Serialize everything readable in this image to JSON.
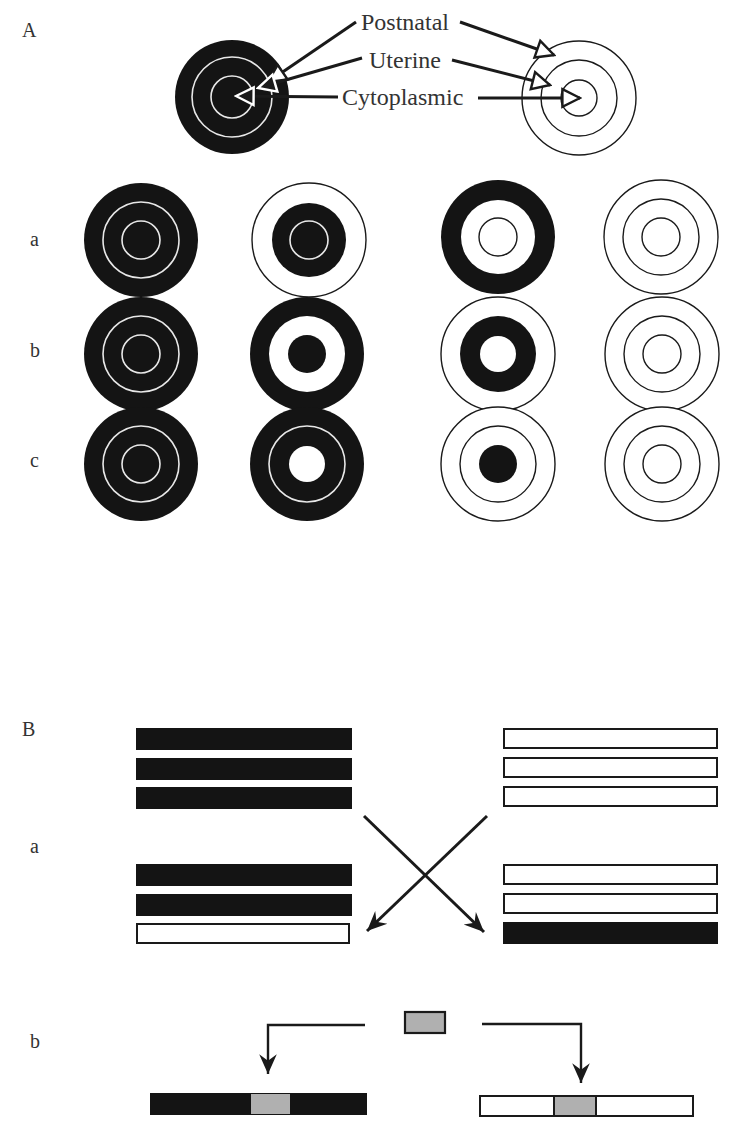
{
  "colors": {
    "ink": "#1a1a1a",
    "fill_dark": "#141414",
    "white": "#ffffff",
    "insert_gray": "#b0b0b0",
    "label_text": "#333333"
  },
  "panel_A": {
    "label": "A",
    "legend": {
      "postnatal": "Postnatal",
      "uterine": "Uterine",
      "cytoplasmic": "Cytoplasmic"
    },
    "rows": [
      {
        "label": "a",
        "targets": [
          "all-dark",
          "dark-inner-two",
          "dark-outer-ring",
          "all-light"
        ]
      },
      {
        "label": "b",
        "targets": [
          "all-dark",
          "dark-outer-and-center",
          "dark-middle-ring",
          "all-light"
        ]
      },
      {
        "label": "c",
        "targets": [
          "all-dark",
          "dark-outer-two",
          "dark-center",
          "all-light"
        ]
      }
    ]
  },
  "panel_B": {
    "label": "B",
    "rows": [
      {
        "label": "a",
        "description": "chromosome exchange between dark and light sets"
      },
      {
        "label": "b",
        "description": "gray segment inserted into dark and light chromosomes"
      }
    ]
  }
}
